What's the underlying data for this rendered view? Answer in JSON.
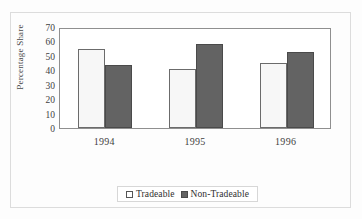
{
  "chart_data": {
    "type": "bar",
    "title": "",
    "subtitle": "",
    "xlabel": "",
    "ylabel": "Percentage Share",
    "categories": [
      "1994",
      "1995",
      "1996"
    ],
    "series": [
      {
        "name": "Tradeable",
        "color": "#f7f7f7",
        "values": [
          55,
          41,
          45
        ]
      },
      {
        "name": "Non-Tradeable",
        "color": "#636363",
        "values": [
          44,
          58,
          53
        ]
      }
    ],
    "ylim": [
      0,
      70
    ],
    "yticks": [
      70,
      60,
      50,
      40,
      30,
      20,
      10,
      0
    ],
    "grid": false,
    "legend_position": "bottom",
    "annotations": []
  },
  "legend": {
    "entries": [
      {
        "label": "Tradeable",
        "swatch": "legend-swatch-tradeable"
      },
      {
        "label": "Non-Tradeable",
        "swatch": "legend-swatch-non-tradeable"
      }
    ]
  }
}
